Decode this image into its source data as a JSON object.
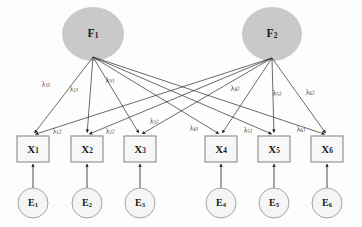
{
  "diagram": {
    "type": "sem-path-diagram",
    "background_color": "#fdfdfd",
    "factor_fill": "#c9c9c9",
    "indicator_fill": "#f7f7f7",
    "indicator_stroke": "#8a8a8a",
    "error_fill": "#f5f5f5",
    "error_stroke": "#9a9a9a",
    "line_color": "#2b2b2b",
    "factors": [
      {
        "id": "F1",
        "base": "F",
        "sub": "1",
        "cx": 93,
        "cy": 34,
        "rx": 31,
        "ry": 27,
        "apex_x": 93,
        "apex_y": 57
      },
      {
        "id": "F2",
        "base": "F",
        "sub": "2",
        "cx": 272,
        "cy": 34,
        "rx": 30,
        "ry": 27,
        "apex_x": 272,
        "apex_y": 58
      }
    ],
    "indicators": [
      {
        "id": "X1",
        "base": "X",
        "sub": "1",
        "x": 17,
        "y": 136,
        "w": 32,
        "h": 26
      },
      {
        "id": "X2",
        "base": "X",
        "sub": "2",
        "x": 71,
        "y": 136,
        "w": 32,
        "h": 26
      },
      {
        "id": "X3",
        "base": "X",
        "sub": "3",
        "x": 124,
        "y": 136,
        "w": 32,
        "h": 26
      },
      {
        "id": "X4",
        "base": "X",
        "sub": "4",
        "x": 205,
        "y": 136,
        "w": 32,
        "h": 26
      },
      {
        "id": "X5",
        "base": "X",
        "sub": "5",
        "x": 258,
        "y": 136,
        "w": 32,
        "h": 26
      },
      {
        "id": "X6",
        "base": "X",
        "sub": "6",
        "x": 311,
        "y": 136,
        "w": 32,
        "h": 26
      }
    ],
    "errors": [
      {
        "id": "E1",
        "base": "E",
        "sub": "1",
        "cx": 33,
        "cy": 203,
        "r": 15
      },
      {
        "id": "E2",
        "base": "E",
        "sub": "2",
        "cx": 87,
        "cy": 203,
        "r": 15
      },
      {
        "id": "E3",
        "base": "E",
        "sub": "3",
        "cx": 140,
        "cy": 203,
        "r": 15
      },
      {
        "id": "E4",
        "base": "E",
        "sub": "4",
        "cx": 221,
        "cy": 203,
        "r": 15
      },
      {
        "id": "E5",
        "base": "E",
        "sub": "5",
        "cx": 274,
        "cy": 203,
        "r": 15
      },
      {
        "id": "E6",
        "base": "E",
        "sub": "6",
        "cx": 327,
        "cy": 203,
        "r": 15
      }
    ],
    "loadings_f1": [
      {
        "id": "l11",
        "base": "λ",
        "sub": "11",
        "from": "F1",
        "to": "X1",
        "lx": 46,
        "ly": 84
      },
      {
        "id": "l21",
        "base": "λ",
        "sub": "21",
        "from": "F1",
        "to": "X2",
        "lx": 74,
        "ly": 89
      },
      {
        "id": "l31",
        "base": "λ",
        "sub": "31",
        "from": "F1",
        "to": "X3",
        "lx": 110,
        "ly": 80
      },
      {
        "id": "l41",
        "base": "λ",
        "sub": "41",
        "from": "F1",
        "to": "X4",
        "lx": 194,
        "ly": 128
      },
      {
        "id": "l51",
        "base": "λ",
        "sub": "51",
        "from": "F1",
        "to": "X5",
        "lx": 248,
        "ly": 130
      },
      {
        "id": "l61",
        "base": "λ",
        "sub": "61",
        "from": "F1",
        "to": "X6",
        "lx": 301,
        "ly": 129
      }
    ],
    "loadings_f2": [
      {
        "id": "l12",
        "base": "λ",
        "sub": "12",
        "from": "F2",
        "to": "X1",
        "lx": 57,
        "ly": 131
      },
      {
        "id": "l22",
        "base": "λ",
        "sub": "22",
        "from": "F2",
        "to": "X2",
        "lx": 110,
        "ly": 131
      },
      {
        "id": "l32",
        "base": "λ",
        "sub": "32",
        "from": "F2",
        "to": "X3",
        "lx": 154,
        "ly": 121
      },
      {
        "id": "l42",
        "base": "λ",
        "sub": "42",
        "from": "F2",
        "to": "X4",
        "lx": 235,
        "ly": 88
      },
      {
        "id": "l52",
        "base": "λ",
        "sub": "52",
        "from": "F2",
        "to": "X5",
        "lx": 277,
        "ly": 93
      },
      {
        "id": "l62",
        "base": "λ",
        "sub": "62",
        "from": "F2",
        "to": "X6",
        "lx": 310,
        "ly": 92
      }
    ]
  }
}
